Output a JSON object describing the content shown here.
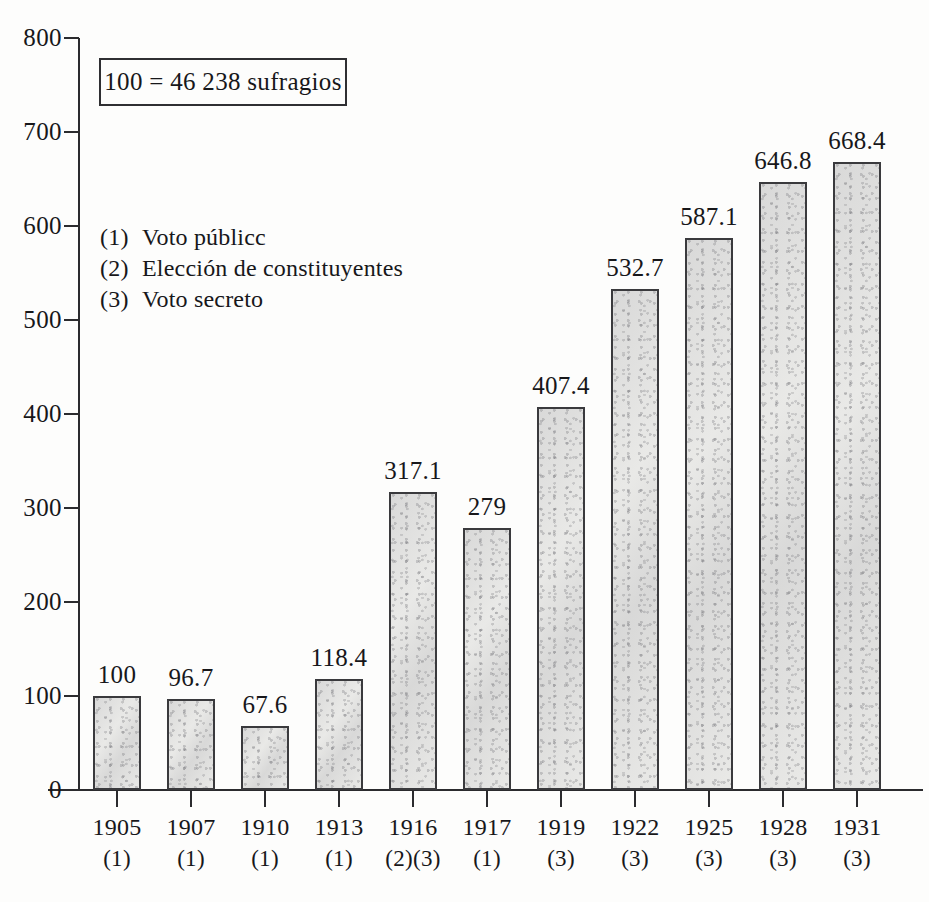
{
  "chart_data": {
    "type": "bar",
    "title": "",
    "subtitle": "",
    "caption_box": "100 = 46 238 sufragios",
    "xlabel": "",
    "ylabel": "",
    "ylim": [
      0,
      800
    ],
    "ytick_step": 100,
    "grid": false,
    "legend_position": "upper-left-inside",
    "categories": [
      "1905",
      "1907",
      "1910",
      "1913",
      "1916",
      "1917",
      "1919",
      "1922",
      "1925",
      "1928",
      "1931"
    ],
    "category_notes": [
      "(1)",
      "(1)",
      "(1)",
      "(1)",
      "(2)(3)",
      "(1)",
      "(3)",
      "(3)",
      "(3)",
      "(3)",
      "(3)"
    ],
    "values": [
      100,
      96.7,
      67.6,
      118.4,
      317.1,
      279,
      407.4,
      532.7,
      587.1,
      646.8,
      668.4
    ],
    "value_labels": [
      "100",
      "96.7",
      "67.6",
      "118.4",
      "317.1",
      "279",
      "407.4",
      "532.7",
      "587.1",
      "646.8",
      "668.4"
    ],
    "ytick_labels": [
      "800",
      "700",
      "600",
      "500",
      "400",
      "300",
      "200",
      "100",
      "0"
    ],
    "ytick_values": [
      800,
      700,
      600,
      500,
      400,
      300,
      200,
      100,
      0
    ],
    "legend": [
      {
        "marker": "(1)",
        "label": "Voto públicc"
      },
      {
        "marker": "(2)",
        "label": "Elección de constituyentes"
      },
      {
        "marker": "(3)",
        "label": "Voto secreto"
      }
    ],
    "colors": {
      "bar_fill": "#e9e9e7",
      "bar_stroke": "#3a3a3d",
      "axis": "#2b2b2e",
      "text": "#17171a",
      "background": "#fdfdfc"
    }
  }
}
